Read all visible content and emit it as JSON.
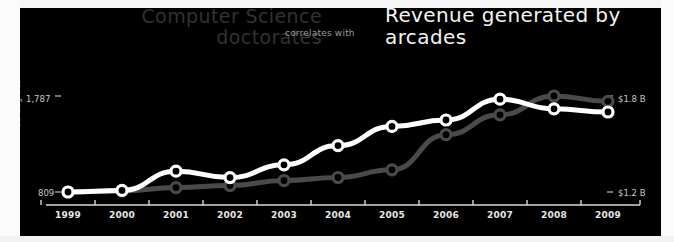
{
  "titles": {
    "left": "Computer Science doctorates",
    "connector": "correlates with",
    "right": "Revenue generated by arcades"
  },
  "axes": {
    "left_label": "CS degrees",
    "left_tick_top": "1,787",
    "left_tick_bottom": "809",
    "right_label": "Arcade revenue",
    "right_tick_top": "$1.8 B",
    "right_tick_bottom": "$1.2 B"
  },
  "colors": {
    "background": "#000000",
    "page": "#f2f2f2",
    "series_arcade": "#ffffff",
    "series_degrees": "#4a4a4a",
    "tick_text": "#c9c9c9",
    "title_left": "#323232",
    "title_right": "#f4f4f4",
    "connector_text": "#9a9a9a"
  },
  "chart_data": {
    "type": "line",
    "title": "Computer Science doctorates correlates with Revenue generated by arcades",
    "xlabel": "",
    "grid": false,
    "legend": "none",
    "categories": [
      "1999",
      "2000",
      "2001",
      "2002",
      "2003",
      "2004",
      "2005",
      "2006",
      "2007",
      "2008",
      "2009"
    ],
    "x": [
      1999,
      2000,
      2001,
      2002,
      2003,
      2004,
      2005,
      2006,
      2007,
      2008,
      2009
    ],
    "series": [
      {
        "name": "Computer Science doctorates",
        "ylabel": "CS degrees",
        "unit": "degrees",
        "color": "#4a4a4a",
        "axis": "left",
        "ylim": [
          809,
          1787
        ],
        "tick_values": [
          809,
          1787
        ],
        "tick_labels": [
          "809",
          "1,787"
        ],
        "values": [
          809,
          819,
          854,
          875,
          926,
          957,
          1035,
          1393,
          1595,
          1787,
          1733
        ]
      },
      {
        "name": "Revenue generated by arcades",
        "ylabel": "Arcade revenue",
        "unit": "billion USD",
        "color": "#ffffff",
        "axis": "right",
        "ylim": [
          1.2,
          1.8
        ],
        "tick_values": [
          1.2,
          1.8
        ],
        "tick_labels": [
          "$1.2 B",
          "$1.8 B"
        ],
        "values": [
          1.2,
          1.21,
          1.33,
          1.29,
          1.37,
          1.49,
          1.61,
          1.65,
          1.78,
          1.72,
          1.7
        ]
      }
    ]
  }
}
